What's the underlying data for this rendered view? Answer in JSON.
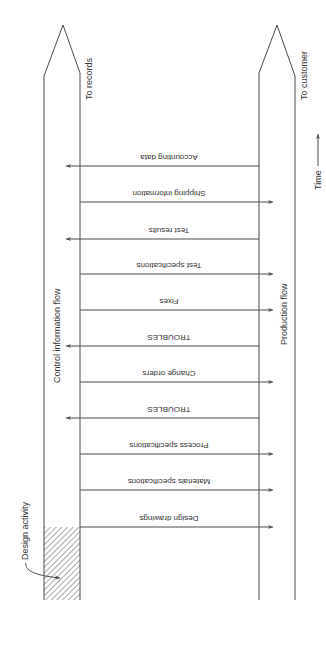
{
  "diagram": {
    "colors": {
      "line": "#4a4a4a",
      "text": "#333333",
      "hatch": "#555555",
      "background": "#ffffff"
    },
    "columns": {
      "control": {
        "label": "Control information flow",
        "destination": "To records"
      },
      "production": {
        "label": "Production flow",
        "destination": "To customer"
      }
    },
    "time_axis": {
      "label": "Time"
    },
    "design_activity": {
      "label": "Design activity"
    },
    "flows": [
      {
        "label": "Accounting data",
        "direction": "to-control"
      },
      {
        "label": "Shipping information",
        "direction": "to-production"
      },
      {
        "label": "Test results",
        "direction": "to-control"
      },
      {
        "label": "Test specifications",
        "direction": "to-production"
      },
      {
        "label": "Fixes",
        "direction": "to-production"
      },
      {
        "label": "TROUBLES",
        "direction": "to-control"
      },
      {
        "label": "Change orders",
        "direction": "to-production"
      },
      {
        "label": "TROUBLES",
        "direction": "to-control"
      },
      {
        "label": "Process specifications",
        "direction": "to-production"
      },
      {
        "label": "Materials specifications",
        "direction": "to-production"
      },
      {
        "label": "Design drawings",
        "direction": "to-production"
      }
    ]
  }
}
